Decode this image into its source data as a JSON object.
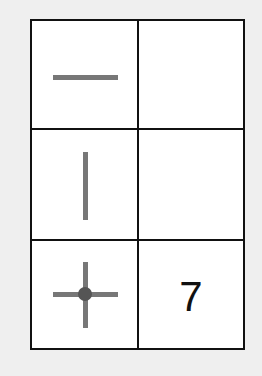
{
  "grid": {
    "rows": 3,
    "cols": 2,
    "cells": [
      {
        "row": 0,
        "col": 0,
        "icon": "horizontal-line-icon",
        "text": ""
      },
      {
        "row": 0,
        "col": 1,
        "icon": null,
        "text": ""
      },
      {
        "row": 1,
        "col": 0,
        "icon": "vertical-line-icon",
        "text": ""
      },
      {
        "row": 1,
        "col": 1,
        "icon": null,
        "text": ""
      },
      {
        "row": 2,
        "col": 0,
        "icon": "crosshair-dot-icon",
        "text": ""
      },
      {
        "row": 2,
        "col": 1,
        "icon": null,
        "text": "7"
      }
    ]
  },
  "colors": {
    "line_stroke": "#777777",
    "dot_fill": "#555555",
    "border": "#111111",
    "background": "#efefef"
  }
}
